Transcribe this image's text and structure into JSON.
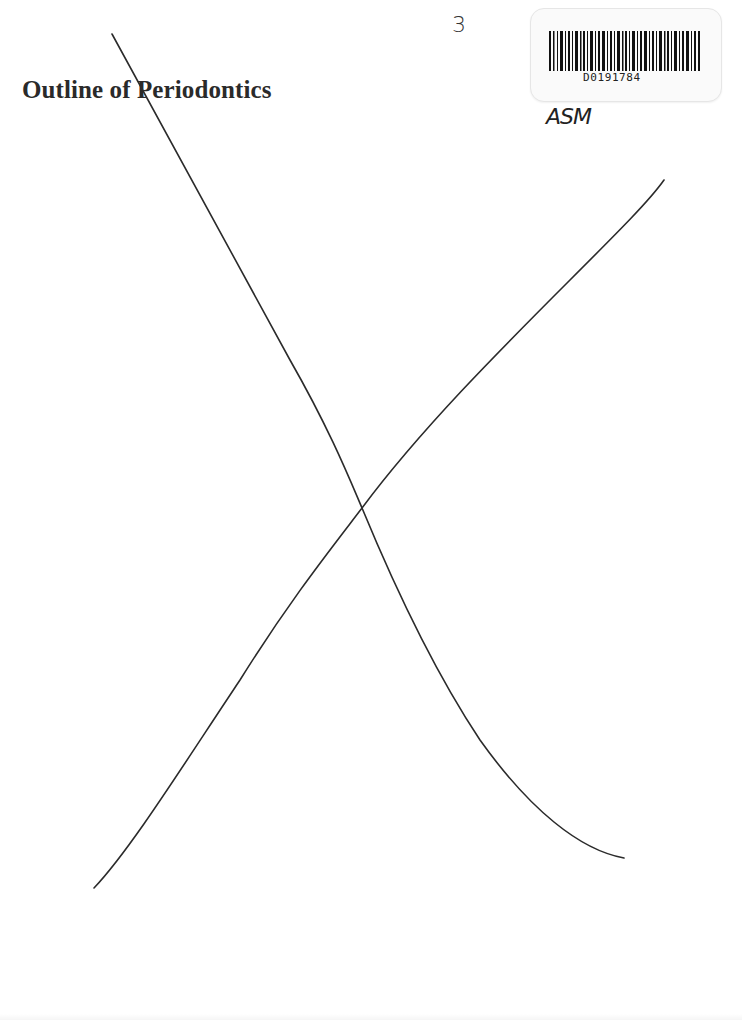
{
  "document": {
    "title": "Outline of Periodontics",
    "page_number_handwritten": "3",
    "barcode": {
      "code": "D0191784"
    },
    "handwritten_initials": "ASM",
    "cross_out": {
      "description": "large hand-drawn X across page",
      "stroke_color": "#2b2b2b"
    }
  }
}
